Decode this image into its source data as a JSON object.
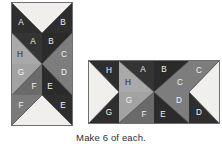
{
  "caption": "Make 6 of each.",
  "palette": {
    "white": "#f0efeb",
    "light_gray": "#a9a9a9",
    "medium_gray": "#7d7d7d",
    "dark": "#2e2e2e",
    "darker": "#242424",
    "border": "#6f6f6f",
    "label_light": "#f2f2f2",
    "label_dark": "#2b2b2b"
  },
  "blocks": [
    {
      "name": "vertical-block",
      "orientation": "vertical",
      "columns": 2,
      "rows": 4,
      "units": [
        {
          "name": "top-white-triangle",
          "shape": "half-square-triangle-down",
          "labels": [
            "A",
            "B"
          ]
        },
        {
          "name": "pinwheel-quadrant-top-left",
          "labels": [
            "A",
            "H"
          ]
        },
        {
          "name": "pinwheel-quadrant-top-right",
          "labels": [
            "B",
            "C"
          ]
        },
        {
          "name": "pinwheel-quadrant-bottom-left",
          "labels": [
            "G",
            "F"
          ]
        },
        {
          "name": "pinwheel-quadrant-bottom-right",
          "labels": [
            "E",
            "D"
          ]
        },
        {
          "name": "bottom-white-triangle",
          "shape": "half-square-triangle-up",
          "labels": [
            "F",
            "E"
          ]
        }
      ]
    },
    {
      "name": "horizontal-block",
      "orientation": "horizontal",
      "columns": 4,
      "rows": 2,
      "units": [
        {
          "name": "left-white-triangle",
          "shape": "half-square-triangle-right",
          "labels": [
            "H",
            "G"
          ]
        },
        {
          "name": "pinwheel-quadrant-top-left",
          "labels": [
            "A",
            "H"
          ]
        },
        {
          "name": "pinwheel-quadrant-top-right",
          "labels": [
            "B",
            "C"
          ]
        },
        {
          "name": "pinwheel-quadrant-bottom-left",
          "labels": [
            "G",
            "F"
          ]
        },
        {
          "name": "pinwheel-quadrant-bottom-right",
          "labels": [
            "E",
            "D"
          ]
        },
        {
          "name": "right-white-triangle",
          "shape": "half-square-triangle-left",
          "labels": [
            "C",
            "D"
          ]
        }
      ]
    }
  ],
  "labels": {
    "A": "A",
    "B": "B",
    "C": "C",
    "D": "D",
    "E": "E",
    "F": "F",
    "G": "G",
    "H": "H"
  }
}
